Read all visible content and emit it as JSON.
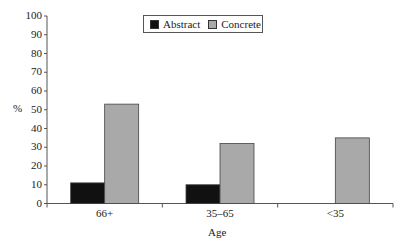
{
  "chart_data": {
    "type": "bar",
    "title": "",
    "xlabel": "Age",
    "ylabel": "%",
    "ylim": [
      0,
      100
    ],
    "yticks": [
      0,
      10,
      20,
      30,
      40,
      50,
      60,
      70,
      80,
      90,
      100
    ],
    "categories": [
      "66+",
      "35–65",
      "<35"
    ],
    "series": [
      {
        "name": "Abstract",
        "color": "#111111",
        "values": [
          11,
          10,
          0
        ]
      },
      {
        "name": "Concrete",
        "color": "#a9a9a9",
        "values": [
          53,
          32,
          35
        ]
      }
    ],
    "legend_position": "top-center",
    "grid": false
  }
}
